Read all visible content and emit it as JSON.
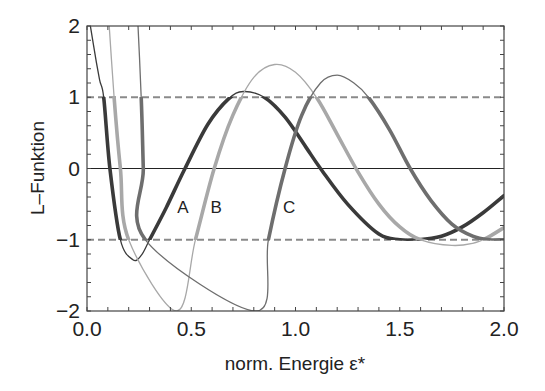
{
  "chart_data": {
    "type": "line",
    "title": "",
    "xlabel": "norm. Energie ε*",
    "ylabel": "L–Funktion",
    "xlim": [
      0.0,
      2.0
    ],
    "ylim": [
      -2,
      2
    ],
    "xticks": [
      "0.0",
      "0.5",
      "1.0",
      "1.5",
      "2.0"
    ],
    "yticks": [
      "2",
      "1",
      "0",
      "-1",
      "-2"
    ],
    "grid": false,
    "legend": "none",
    "reference_lines": [
      {
        "y": 1,
        "style": "dashed",
        "color": "#8a8a8a"
      },
      {
        "y": -1,
        "style": "dashed",
        "color": "#8a8a8a"
      },
      {
        "y": 0,
        "style": "solid",
        "color": "#222222"
      }
    ],
    "annotations": [
      {
        "text": "A",
        "x": 0.46,
        "y": -0.63
      },
      {
        "text": "B",
        "x": 0.62,
        "y": -0.63
      },
      {
        "text": "C",
        "x": 0.97,
        "y": -0.63
      }
    ],
    "series": [
      {
        "name": "A",
        "color": "#3a3a3a",
        "x": [
          0.0,
          0.03,
          0.06,
          0.08,
          0.11,
          0.16,
          0.22,
          0.26,
          0.3,
          0.38,
          0.47,
          0.58,
          0.68,
          0.75,
          0.85,
          0.95,
          1.05,
          1.12,
          1.25,
          1.4,
          1.5,
          1.59,
          1.7,
          1.8,
          1.9,
          2.0
        ],
        "y": [
          2.3,
          1.75,
          1.25,
          1.0,
          0.0,
          -1.0,
          -1.28,
          -1.22,
          -1.0,
          -0.55,
          0.0,
          0.62,
          0.98,
          1.08,
          1.0,
          0.72,
          0.3,
          0.0,
          -0.5,
          -0.92,
          -1.0,
          -1.0,
          -0.95,
          -0.82,
          -0.62,
          -0.38
        ]
      },
      {
        "name": "B",
        "color": "#a8a8a8",
        "x": [
          0.1,
          0.13,
          0.16,
          0.2,
          0.43,
          0.52,
          0.61,
          0.7,
          0.8,
          0.9,
          1.0,
          1.1,
          1.2,
          1.3,
          1.4,
          1.5,
          1.6,
          1.75,
          1.85,
          1.92,
          2.0
        ],
        "y": [
          2.3,
          1.0,
          0.0,
          -1.0,
          -2.0,
          -1.0,
          0.0,
          0.75,
          1.28,
          1.46,
          1.35,
          1.0,
          0.48,
          -0.05,
          -0.5,
          -0.82,
          -1.0,
          -1.08,
          -1.05,
          -0.97,
          -0.83
        ]
      },
      {
        "name": "C",
        "color": "#6e6e6e",
        "x": [
          0.24,
          0.26,
          0.27,
          0.28,
          0.81,
          0.87,
          0.95,
          1.03,
          1.12,
          1.2,
          1.28,
          1.35,
          1.45,
          1.55,
          1.65,
          1.75,
          1.85,
          1.93,
          2.0
        ],
        "y": [
          2.3,
          1.0,
          0.0,
          -1.0,
          -2.0,
          -1.0,
          0.0,
          0.75,
          1.2,
          1.31,
          1.2,
          1.0,
          0.55,
          0.0,
          -0.45,
          -0.78,
          -0.95,
          -1.0,
          -1.0
        ]
      }
    ]
  }
}
